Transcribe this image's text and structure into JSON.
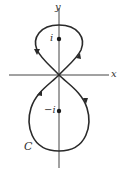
{
  "diagram": {
    "type": "complex-plane-contour",
    "axes": {
      "x_label": "x",
      "y_label": "y"
    },
    "points": [
      {
        "label": "i",
        "name": "point-i"
      },
      {
        "label": "−i",
        "name": "point-neg-i"
      }
    ],
    "contour": {
      "label": "C",
      "shape": "figure-eight",
      "upper_loop_orientation": "clockwise",
      "lower_loop_orientation": "counterclockwise",
      "arrow_count": 4
    },
    "colors": {
      "curve": "#2a2a2a",
      "axes": "#444444",
      "text": "#333333",
      "background": "#ffffff"
    }
  }
}
